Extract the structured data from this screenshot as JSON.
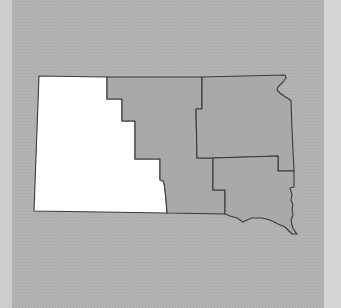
{
  "map": {
    "subject": "regional map with western region highlighted",
    "colors": {
      "background": "#b2b2b2",
      "left_strip": "#cdcdcd",
      "right_strip": "#d6d6d6",
      "highlighted_region": "#ffffff",
      "other_regions": "#a9a9a9",
      "border": "#3a3a3a"
    },
    "regions": [
      {
        "id": "west",
        "highlighted": true,
        "path": "M39,76 L107,77 L107,99 L122,99 L122,121 L135,121 L135,159 L160,159 L160,180 L163,181 L164,183 L165,190 L166,200 L167,213 L34,211 Z"
      },
      {
        "id": "central",
        "highlighted": false,
        "path": "M107,77 L202,77 L202,109 L196,109 L197,158 L213,158 L213,190 L225,190 L225,214 L167,213 L166,200 L165,190 L164,183 L163,181 L160,180 L160,159 L135,159 L135,121 L122,121 L122,99 L107,99 Z"
      },
      {
        "id": "northeast",
        "highlighted": false,
        "path": "M202,77 L285,75 L286,78 L283,82 L278,87 L277,90 L280,93 L284,96 L289,99 L291,101 L292,130 L294,171 L278,171 L278,156 L213,158 L197,158 L196,109 L202,109 Z"
      },
      {
        "id": "southeast",
        "highlighted": false,
        "path": "M213,158 L278,156 L278,171 L294,171 L294,187 L290,188 L292,195 L291,200 L293,205 L292,210 L293,215 L291,220 L292,225 L293,228 L296,233 L297,234 L292,234 L289,231 L285,227 L278,224 L270,220 L262,218 L252,218 L247,220 L243,222 L237,218 L230,216 L225,214 L225,190 L213,190 Z"
      }
    ]
  }
}
